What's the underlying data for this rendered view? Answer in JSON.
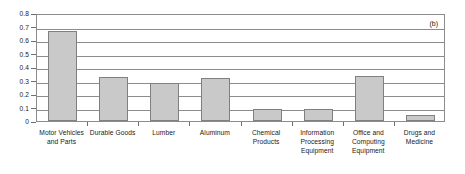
{
  "chart_data": {
    "type": "bar",
    "title": "",
    "subtitle": "",
    "xlabel": "",
    "ylabel": "",
    "ylim": [
      0,
      0.8
    ],
    "ytick_step": 0.1,
    "yticks": [
      "0.8",
      "0.7",
      "0.6",
      "0.5",
      "0.4",
      "0.3",
      "0.2",
      "0.1",
      "0"
    ],
    "ytick_values": [
      0.8,
      0.7,
      0.6,
      0.5,
      0.4,
      0.3,
      0.2,
      0.1,
      0
    ],
    "grid": true,
    "grid_axis": "y",
    "legend": null,
    "legend_position": "none",
    "annotation": "(b)",
    "annotation_position": "top-right",
    "categories": [
      "Motor Vehicles and Parts",
      "Durable Goods",
      "Lumber",
      "Aluminum",
      "Chemical Products",
      "Information Processing Equipment",
      "Office and Computing Equipment",
      "Drugs and Medicine"
    ],
    "category_lines": [
      [
        "Motor Vehicles",
        "and Parts"
      ],
      [
        "Durable Goods"
      ],
      [
        "Lumber"
      ],
      [
        "Aluminum"
      ],
      [
        "Chemical",
        "Products"
      ],
      [
        "Information",
        "Processing",
        "Equipment"
      ],
      [
        "Office and",
        "Computing",
        "Equipment"
      ],
      [
        "Drugs and",
        "Medicine"
      ]
    ],
    "values": [
      0.67,
      0.325,
      0.285,
      0.32,
      0.09,
      0.09,
      0.33,
      0.045
    ],
    "bar_color": "#c9c9c9",
    "bar_border_color": "#808080",
    "axis_color": "#8c8c8c",
    "background": "#ffffff"
  }
}
